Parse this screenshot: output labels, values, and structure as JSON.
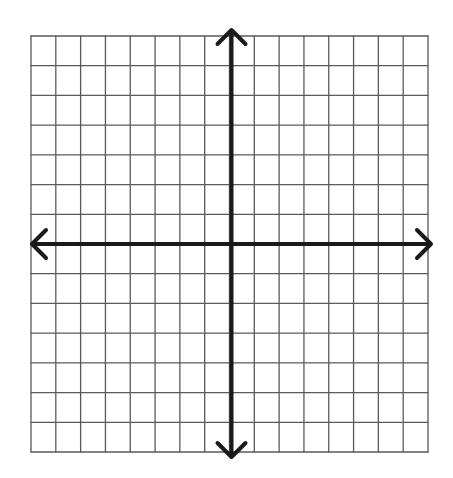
{
  "diagram": {
    "type": "coordinate-plane",
    "grid": {
      "columns": 16,
      "rows": 14,
      "left": 31,
      "top": 36,
      "right": 428,
      "bottom": 452,
      "line_color": "#5a5a5a"
    },
    "axes": {
      "color": "#1a1a1a",
      "thickness": 4,
      "x_axis_row": 7,
      "y_axis_col": 8,
      "x_arrow_left": 32,
      "x_arrow_right": 431,
      "y_arrow_top": 30,
      "y_arrow_bottom": 457
    }
  }
}
